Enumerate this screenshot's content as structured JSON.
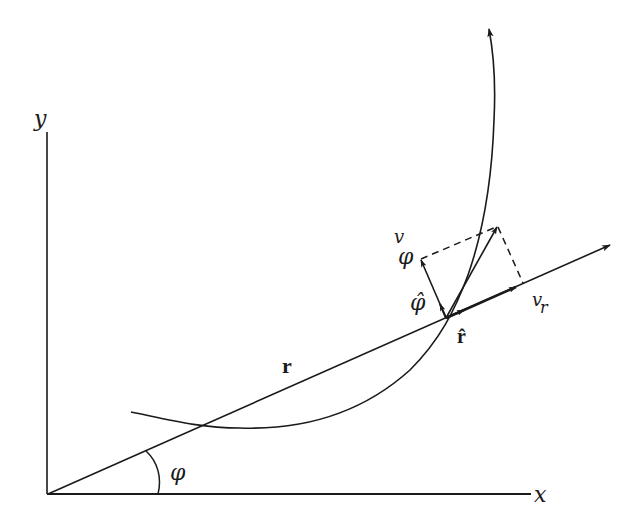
{
  "diagram": {
    "colors": {
      "ink": "#1a1a1a",
      "background": "#ffffff"
    },
    "labels": {
      "y_axis": "y",
      "x_axis": "x",
      "angle": "φ",
      "position_vector": "r",
      "unit_r": "r̂",
      "unit_phi": "φ̂",
      "v_phi_main": "v",
      "v_phi_sub": "φ",
      "v_r_main": "v",
      "v_r_sub": "r"
    },
    "elements": [
      "x-axis",
      "y-axis",
      "trajectory-curve",
      "radial-line",
      "angle-arc",
      "velocity-vector",
      "radial-velocity-component",
      "transverse-velocity-component",
      "unit-vector-r",
      "unit-vector-phi",
      "dashed-projection-lines"
    ]
  }
}
